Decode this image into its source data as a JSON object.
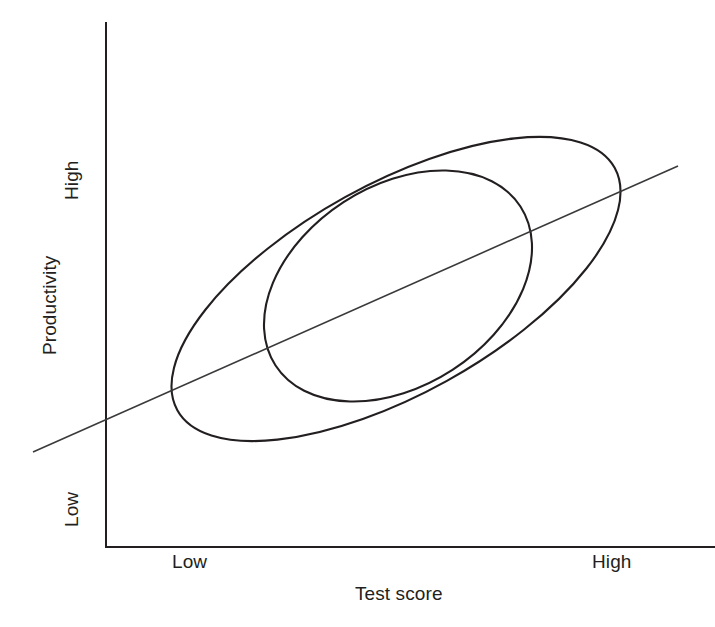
{
  "chart_data": {
    "type": "scatter",
    "title": "",
    "subtitle": "",
    "xlabel": "Test score",
    "ylabel": "Productivity",
    "x_tick_labels": [
      "Low",
      "High"
    ],
    "y_tick_labels": [
      "Low",
      "High"
    ],
    "xlim": [
      "Low",
      "High"
    ],
    "ylim": [
      "Low",
      "High"
    ],
    "grid": false,
    "legend": "none",
    "annotations": [],
    "series": [
      {
        "name": "wide-scatter-envelope",
        "shape": "ellipse",
        "center_x_px": 396,
        "center_y_px": 289,
        "semi_major_px": 250,
        "semi_minor_px": 105,
        "rotation_deg": -29,
        "stroke": "#231f20",
        "stroke_width": 2.1,
        "fill": "none"
      },
      {
        "name": "narrow-scatter-envelope",
        "shape": "ellipse",
        "center_x_px": 398,
        "center_y_px": 286,
        "semi_major_px": 146,
        "semi_minor_px": 100,
        "rotation_deg": -33,
        "stroke": "#231f20",
        "stroke_width": 2.1,
        "fill": "none"
      },
      {
        "name": "regression-line",
        "shape": "line",
        "x1_px": 33,
        "y1_px": 452,
        "x2_px": 678,
        "y2_px": 166,
        "slope_sign": "positive",
        "stroke": "#3a3a3c",
        "stroke_width": 1.6
      }
    ],
    "axes": {
      "y_axis": {
        "x_px": 106,
        "y_top_px": 22,
        "y_bottom_px": 547
      },
      "x_axis": {
        "y_px": 547,
        "x_left_px": 106,
        "x_right_px": 715
      },
      "stroke": "#231f20",
      "stroke_width": 2
    }
  },
  "chart": {
    "y_axis": {
      "title": "Productivity",
      "tick_high": "High",
      "tick_low": "Low"
    },
    "x_axis": {
      "title": "Test score",
      "tick_low": "Low",
      "tick_high": "High"
    }
  },
  "colors": {
    "background": "#ffffff",
    "ink": "#231f20",
    "line": "#3a3a3c"
  }
}
